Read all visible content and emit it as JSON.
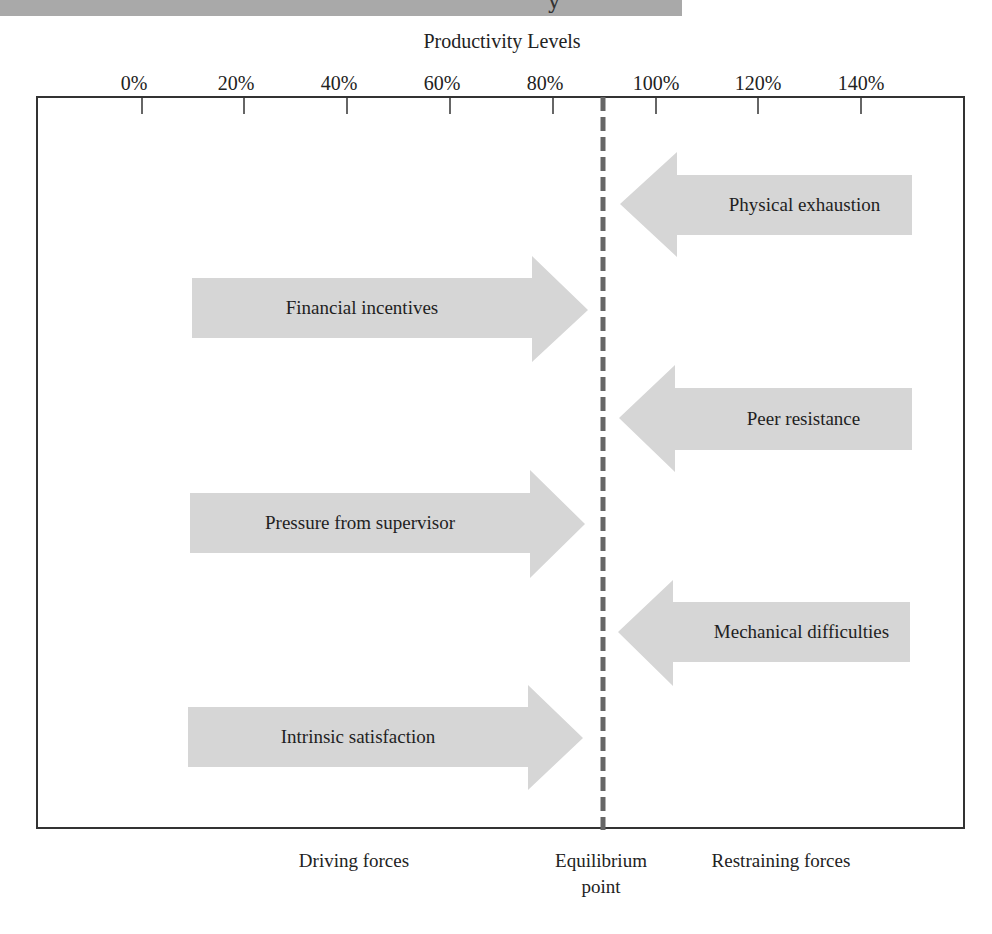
{
  "header": {
    "banner_fragment": "y"
  },
  "axis": {
    "title": "Productivity Levels",
    "ticks": [
      {
        "label": "0%",
        "x": 142
      },
      {
        "label": "20%",
        "x": 244
      },
      {
        "label": "40%",
        "x": 347
      },
      {
        "label": "60%",
        "x": 450
      },
      {
        "label": "80%",
        "x": 553
      },
      {
        "label": "100%",
        "x": 656
      },
      {
        "label": "120%",
        "x": 758
      },
      {
        "label": "140%",
        "x": 861
      }
    ]
  },
  "equilibrium": {
    "label_line1": "Equilibrium",
    "label_line2": "point",
    "position_percent": 89,
    "x": 603
  },
  "driving_forces": {
    "label": "Driving forces",
    "items": [
      {
        "label": "Financial incentives",
        "left": 192,
        "body_top": 278,
        "body_bottom": 338,
        "head_x": 532,
        "head_top": 256,
        "head_bottom": 362,
        "tip_x": 588,
        "tip_y": 310
      },
      {
        "label": "Pressure from supervisor",
        "left": 190,
        "body_top": 493,
        "body_bottom": 553,
        "head_x": 530,
        "head_top": 470,
        "head_bottom": 578,
        "tip_x": 585,
        "tip_y": 524
      },
      {
        "label": "Intrinsic satisfaction",
        "left": 188,
        "body_top": 707,
        "body_bottom": 767,
        "head_x": 528,
        "head_top": 685,
        "head_bottom": 790,
        "tip_x": 583,
        "tip_y": 738
      }
    ]
  },
  "restraining_forces": {
    "label": "Restraining forces",
    "items": [
      {
        "label": "Physical exhaustion",
        "right": 912,
        "body_top": 175,
        "body_bottom": 235,
        "head_x": 677,
        "head_top": 152,
        "head_bottom": 257,
        "tip_x": 620,
        "tip_y": 204
      },
      {
        "label": "Peer resistance",
        "right": 912,
        "body_top": 388,
        "body_bottom": 450,
        "head_x": 675,
        "head_top": 365,
        "head_bottom": 472,
        "tip_x": 619,
        "tip_y": 418
      },
      {
        "label": "Mechanical difficulties",
        "right": 910,
        "body_top": 602,
        "body_bottom": 662,
        "head_x": 673,
        "head_top": 580,
        "head_bottom": 686,
        "tip_x": 618,
        "tip_y": 632
      }
    ]
  },
  "colors": {
    "arrow_fill": "#d6d6d6",
    "frame": "#333333",
    "dashed_line": "#666666",
    "banner": "#a9a9a9",
    "text": "#222222"
  }
}
